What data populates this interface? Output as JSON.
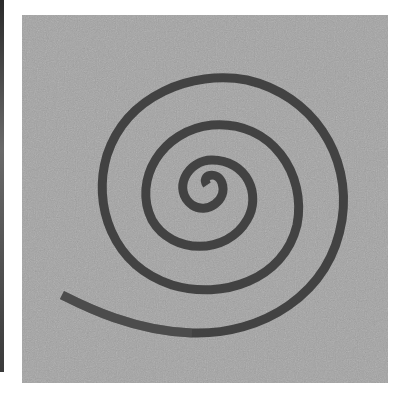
{
  "image": {
    "subject": "metal spiral on stone surface",
    "style": "grayscale photograph",
    "colors": {
      "background": "#ffffff",
      "stone": "#a3a3a3",
      "metal": "#3a3a3a",
      "left_strip": "#3a3a3a"
    }
  }
}
